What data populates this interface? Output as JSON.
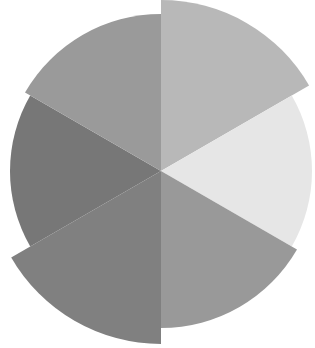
{
  "chart_data": {
    "type": "pie",
    "subtype": "polar-area",
    "title": "",
    "xlabel": "",
    "ylabel": "",
    "legend": [],
    "grid": false,
    "center": [
      161,
      171
    ],
    "start_angle_deg": -90,
    "categories": [
      "Slice 1",
      "Slice 2",
      "Slice 3",
      "Slice 4",
      "Slice 5",
      "Slice 6"
    ],
    "angles_deg": [
      60,
      60,
      60,
      60,
      60,
      60
    ],
    "values": [
      171,
      151,
      157,
      173,
      151,
      157
    ],
    "value_meaning": "radius in px",
    "colors": [
      "#b8b8b8",
      "#e6e6e6",
      "#999999",
      "#808080",
      "#777777",
      "#9a9a9a"
    ]
  }
}
